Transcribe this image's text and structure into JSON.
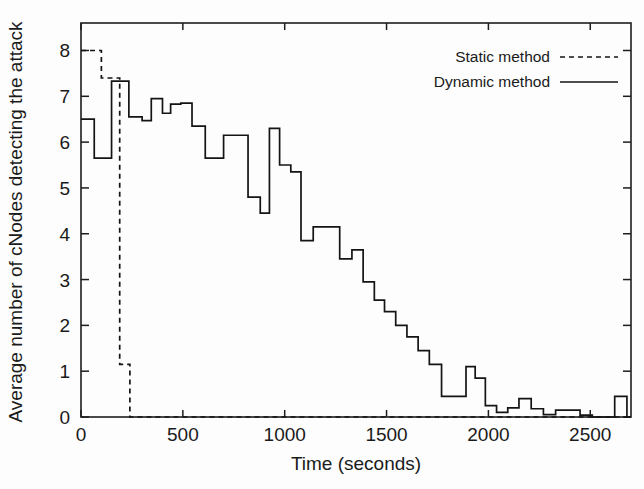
{
  "chart_data": {
    "type": "line",
    "subtype": "step-post",
    "title": "",
    "xlabel": "Time (seconds)",
    "ylabel": "Average number of cNodes detecting the attack",
    "xlim": [
      0,
      2700
    ],
    "ylim": [
      0,
      8.6
    ],
    "xticks": [
      0,
      500,
      1000,
      1500,
      2000,
      2500
    ],
    "xticklabels": [
      "0",
      "500",
      "1000",
      "1500",
      "2000",
      "2500"
    ],
    "yticks": [
      0,
      1,
      2,
      3,
      4,
      5,
      6,
      7,
      8
    ],
    "yticklabels": [
      "0",
      "1",
      "2",
      "3",
      "4",
      "5",
      "6",
      "7",
      "8"
    ],
    "grid": false,
    "legend_position": "top-right",
    "series": [
      {
        "name": "Static method",
        "style": "dashed",
        "x": [
          0,
          100,
          190,
          240
        ],
        "values": [
          8.0,
          7.4,
          1.15,
          0.0
        ]
      },
      {
        "name": "Dynamic method",
        "style": "solid",
        "x": [
          0,
          65,
          150,
          235,
          300,
          345,
          400,
          440,
          490,
          545,
          610,
          700,
          755,
          820,
          880,
          925,
          975,
          1030,
          1080,
          1140,
          1205,
          1270,
          1330,
          1385,
          1440,
          1490,
          1545,
          1600,
          1655,
          1710,
          1770,
          1835,
          1890,
          1935,
          1985,
          2040,
          2095,
          2150,
          2210,
          2270,
          2330,
          2390,
          2450,
          2510,
          2570,
          2620,
          2680
        ],
        "values": [
          6.5,
          5.65,
          7.33,
          6.55,
          6.47,
          6.95,
          6.63,
          6.83,
          6.85,
          6.35,
          5.65,
          6.15,
          6.15,
          4.8,
          4.45,
          6.3,
          5.5,
          5.35,
          3.85,
          4.15,
          4.15,
          3.45,
          3.65,
          2.95,
          2.55,
          2.3,
          2.0,
          1.75,
          1.45,
          1.15,
          0.45,
          0.45,
          1.1,
          0.85,
          0.25,
          0.1,
          0.2,
          0.4,
          0.18,
          0.05,
          0.15,
          0.15,
          0.04,
          0.0,
          0.0,
          0.45,
          0.0
        ]
      }
    ],
    "legend": [
      {
        "label": "Static method",
        "style": "dashed"
      },
      {
        "label": "Dynamic method",
        "style": "solid"
      }
    ]
  }
}
